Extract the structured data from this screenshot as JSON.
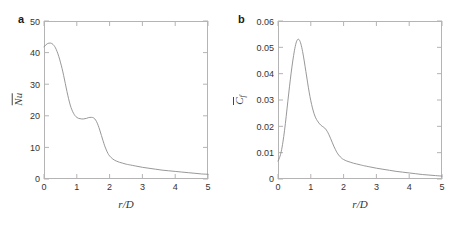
{
  "figure": {
    "background_color": "#ffffff",
    "axis_color": "#b4b4b4",
    "curve_color": "#8c8c8c",
    "text_color": "#333333"
  },
  "panels": [
    {
      "letter": "a",
      "xlabel_num": "r",
      "xlabel_den": "D",
      "ylabel_main": "Nu",
      "ylabel_sub": "",
      "xtick_labels": [
        "0",
        "1",
        "2",
        "3",
        "4",
        "5"
      ],
      "ytick_labels": [
        "0",
        "10",
        "20",
        "30",
        "40",
        "50"
      ]
    },
    {
      "letter": "b",
      "xlabel_num": "r",
      "xlabel_den": "D",
      "ylabel_main": "C",
      "ylabel_sub": "f",
      "xtick_labels": [
        "0",
        "1",
        "2",
        "3",
        "4",
        "5"
      ],
      "ytick_labels": [
        "0",
        "0.01",
        "0.02",
        "0.03",
        "0.04",
        "0.05",
        "0.06"
      ]
    }
  ],
  "chart_data": [
    {
      "type": "line",
      "panel": "a",
      "title": "",
      "xlabel": "r/D",
      "ylabel": "Nu (mean Nusselt number)",
      "xlim": [
        0,
        5
      ],
      "ylim": [
        0,
        50
      ],
      "xticks": [
        0,
        1,
        2,
        3,
        4,
        5
      ],
      "yticks": [
        0,
        10,
        20,
        30,
        40,
        50
      ],
      "grid": false,
      "legend": "none",
      "annotations": [
        "peak Nu ~43 near r/D=0.2",
        "local plateau Nu ~19 near r/D=1.0-1.4",
        "secondary bump Nu ~19.5 at r/D=1.5"
      ],
      "series": [
        {
          "name": "mean Nusselt number",
          "x": [
            0.0,
            0.05,
            0.1,
            0.15,
            0.2,
            0.25,
            0.3,
            0.35,
            0.4,
            0.45,
            0.5,
            0.55,
            0.6,
            0.65,
            0.7,
            0.75,
            0.8,
            0.85,
            0.9,
            0.95,
            1.0,
            1.05,
            1.1,
            1.15,
            1.2,
            1.25,
            1.3,
            1.35,
            1.4,
            1.45,
            1.5,
            1.55,
            1.6,
            1.65,
            1.7,
            1.75,
            1.8,
            1.85,
            1.9,
            1.95,
            2.0,
            2.1,
            2.2,
            2.3,
            2.4,
            2.5,
            2.6,
            2.8,
            3.0,
            3.2,
            3.4,
            3.6,
            3.8,
            4.0,
            4.2,
            4.4,
            4.6,
            4.8,
            5.0
          ],
          "y": [
            41.8,
            42.4,
            42.8,
            43.0,
            43.0,
            42.8,
            42.3,
            41.5,
            40.3,
            38.8,
            37.0,
            35.0,
            32.7,
            30.2,
            27.7,
            25.4,
            23.4,
            21.9,
            20.8,
            20.0,
            19.5,
            19.2,
            19.1,
            19.0,
            19.0,
            19.1,
            19.2,
            19.4,
            19.5,
            19.5,
            19.4,
            19.0,
            18.2,
            17.0,
            15.5,
            13.8,
            12.1,
            10.5,
            9.2,
            8.1,
            7.3,
            6.3,
            5.7,
            5.3,
            5.0,
            4.7,
            4.5,
            4.1,
            3.7,
            3.4,
            3.1,
            2.8,
            2.6,
            2.4,
            2.2,
            2.0,
            1.8,
            1.6,
            1.5
          ]
        }
      ]
    },
    {
      "type": "line",
      "panel": "b",
      "title": "",
      "xlabel": "r/D",
      "ylabel": "Cf (mean skin friction coefficient)",
      "xlim": [
        0,
        5
      ],
      "ylim": [
        0,
        0.06
      ],
      "xticks": [
        0,
        1,
        2,
        3,
        4,
        5
      ],
      "yticks": [
        0,
        0.01,
        0.02,
        0.03,
        0.04,
        0.05,
        0.06
      ],
      "grid": false,
      "legend": "none",
      "annotations": [
        "starts at Cf ~0.007 at r/D=0",
        "sharp peak Cf ~0.053 at r/D=0.6",
        "shoulder Cf ~0.020 near r/D=1.3",
        "decays to ~0.001 at r/D=5"
      ],
      "series": [
        {
          "name": "mean skin friction coefficient",
          "x": [
            0.0,
            0.05,
            0.1,
            0.15,
            0.2,
            0.25,
            0.3,
            0.35,
            0.4,
            0.45,
            0.5,
            0.55,
            0.6,
            0.65,
            0.7,
            0.75,
            0.8,
            0.85,
            0.9,
            0.95,
            1.0,
            1.05,
            1.1,
            1.15,
            1.2,
            1.25,
            1.3,
            1.35,
            1.4,
            1.45,
            1.5,
            1.55,
            1.6,
            1.65,
            1.7,
            1.75,
            1.8,
            1.85,
            1.9,
            1.95,
            2.0,
            2.1,
            2.2,
            2.3,
            2.4,
            2.5,
            2.6,
            2.8,
            3.0,
            3.2,
            3.4,
            3.6,
            3.8,
            4.0,
            4.2,
            4.4,
            4.6,
            4.8,
            5.0
          ],
          "y": [
            0.0068,
            0.0082,
            0.0105,
            0.014,
            0.0185,
            0.0238,
            0.0295,
            0.035,
            0.0402,
            0.0448,
            0.0487,
            0.0516,
            0.053,
            0.0528,
            0.0512,
            0.0484,
            0.0448,
            0.0408,
            0.0368,
            0.033,
            0.0297,
            0.027,
            0.0248,
            0.0232,
            0.0221,
            0.0212,
            0.0205,
            0.02,
            0.0196,
            0.019,
            0.0181,
            0.0169,
            0.0155,
            0.014,
            0.0125,
            0.0112,
            0.01,
            0.0091,
            0.0084,
            0.0078,
            0.0074,
            0.0068,
            0.0064,
            0.006,
            0.0057,
            0.0054,
            0.0051,
            0.0046,
            0.0041,
            0.0037,
            0.0033,
            0.0029,
            0.0026,
            0.0023,
            0.002,
            0.0017,
            0.0015,
            0.0013,
            0.0011
          ]
        }
      ]
    }
  ]
}
